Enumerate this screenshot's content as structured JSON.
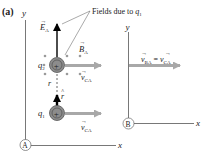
{
  "panel_label": "(a)",
  "frame_A": {
    "label": "A",
    "x_axis": "x",
    "y_axis": "y"
  },
  "frame_B": {
    "label": "B",
    "x_axis": "x",
    "y_axis": "y"
  },
  "charges": [
    {
      "name": "q",
      "sub": "2",
      "sign": "+"
    },
    {
      "name": "q",
      "sub": "1",
      "sign": "+"
    }
  ],
  "vectors": {
    "E": {
      "sym": "E",
      "sub": "A"
    },
    "B": {
      "sym": "B",
      "sub": "A"
    },
    "v_CA_q2": {
      "sym": "v",
      "sub": "CA"
    },
    "v_CA_q1": {
      "sym": "v",
      "sub": "CA"
    },
    "r_hat": {
      "sym": "r"
    },
    "r": {
      "sym": "r"
    },
    "v_BA": {
      "lhs_sym": "v",
      "lhs_sub": "BA",
      "eq": "=",
      "rhs_sym": "v",
      "rhs_sub": "CA"
    }
  },
  "annotation": {
    "text": "Fields due to ",
    "sym": "q",
    "sub": "1"
  },
  "colors": {
    "axis": "#444444",
    "charge_fill": "#8c8c8c",
    "arrow_gray": "#a8a8a8",
    "arrow_dark": "#333333",
    "field_arrow": "#000000",
    "dot": "#9a9a9a"
  }
}
